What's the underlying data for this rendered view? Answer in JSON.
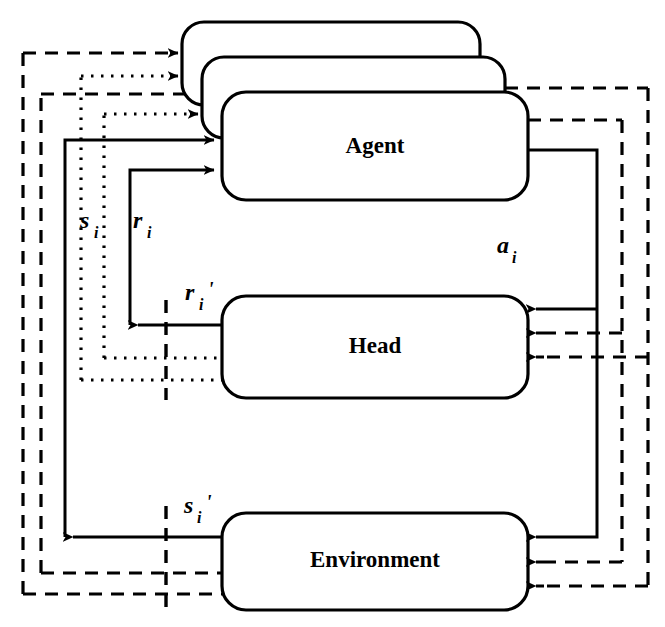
{
  "diagram": {
    "background_color": "#ffffff",
    "stroke_color": "#000000",
    "nodes": [
      {
        "id": "agent_back",
        "label": "",
        "shape": "rounded-rect",
        "x": 182,
        "y": 22,
        "w": 298,
        "h": 83,
        "layer": 1
      },
      {
        "id": "agent_mid",
        "label": "",
        "shape": "rounded-rect",
        "x": 202,
        "y": 57,
        "w": 303,
        "h": 81,
        "layer": 2
      },
      {
        "id": "agent_front",
        "label": "Agent",
        "shape": "rounded-rect",
        "x": 222,
        "y": 92,
        "w": 306,
        "h": 108,
        "layer": 3
      },
      {
        "id": "head",
        "label": "Head",
        "shape": "rounded-rect",
        "x": 222,
        "y": 296,
        "w": 306,
        "h": 102,
        "layer": 1
      },
      {
        "id": "environment",
        "label": "Environment",
        "shape": "rounded-rect",
        "x": 222,
        "y": 513,
        "w": 306,
        "h": 97,
        "layer": 1
      }
    ],
    "edge_labels": [
      {
        "id": "s_i",
        "base": "s",
        "sub": "i",
        "prime": "",
        "x": 82,
        "y": 228
      },
      {
        "id": "r_i",
        "base": "r",
        "sub": "i",
        "prime": "",
        "x": 132,
        "y": 228
      },
      {
        "id": "r_i_prime",
        "base": "r",
        "sub": "i",
        "prime": "'",
        "x": 184,
        "y": 300
      },
      {
        "id": "a_i",
        "base": "a",
        "sub": "i",
        "prime": "",
        "x": 498,
        "y": 253
      },
      {
        "id": "s_i_prime",
        "base": "s",
        "sub": "i",
        "prime": "'",
        "x": 183,
        "y": 513
      }
    ],
    "line_styles": {
      "solid": "solid",
      "dashed": "dashed",
      "dotted": "dotted"
    },
    "legend_note": "Solid = current agent signals; dashed and dotted = replicated signals for stacked agent copies"
  }
}
